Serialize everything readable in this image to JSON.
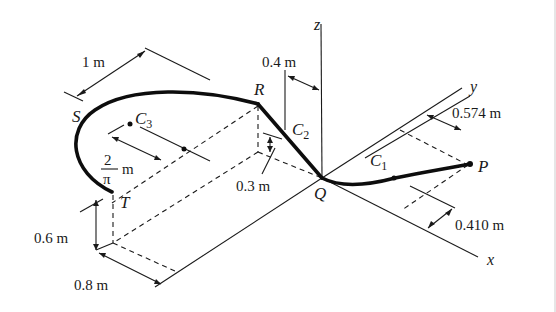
{
  "figure": {
    "axes": {
      "x": "x",
      "y": "y",
      "z": "z"
    },
    "points": {
      "P": "P",
      "Q": "Q",
      "R": "R",
      "S": "S",
      "T": "T"
    },
    "centroids": {
      "c1": {
        "base": "C",
        "sub": "1"
      },
      "c2": {
        "base": "C",
        "sub": "2"
      },
      "c3": {
        "base": "C",
        "sub": "3"
      }
    },
    "dimensions": {
      "d_1m": "1 m",
      "d_04m": "0.4 m",
      "d_0574m": "0.574 m",
      "d_0410m": "0.410 m",
      "d_03m": "0.3 m",
      "d_06m": "0.6 m",
      "d_08m": "0.8 m",
      "d_2pi_num": "2",
      "d_2pi_den": "π",
      "d_2pi_unit": "m"
    },
    "colors": {
      "line": "#1a1a1a",
      "rod": "#0d0d0d",
      "background": "#ffffff"
    }
  }
}
